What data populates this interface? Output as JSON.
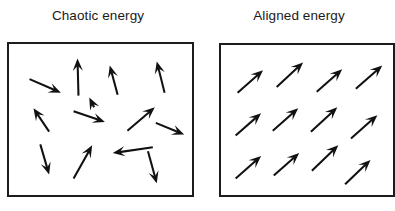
{
  "figure": {
    "width": 392,
    "height": 211,
    "background_color": "#ffffff",
    "ink_color": "#111111",
    "caption_color": "#1a1a1a",
    "type": "two-panel-vector-field-diagram"
  },
  "panels": [
    {
      "id": "chaotic",
      "title": "Chaotic energy",
      "box": {
        "x": 7,
        "y": 42,
        "width": 187,
        "height": 155,
        "border_color": "#1c1c1c",
        "border_width": 2.2
      },
      "arrow_count": 13,
      "arrow_arrangement": "random",
      "arrows": [
        {
          "name": "arrow-1",
          "x1": 28,
          "y1": 78,
          "x2": 60,
          "y2": 92,
          "angle_deg": 24
        },
        {
          "name": "arrow-2",
          "x1": 78,
          "y1": 95,
          "x2": 77,
          "y2": 57,
          "angle_deg": 272
        },
        {
          "name": "arrow-3",
          "x1": 118,
          "y1": 94,
          "x2": 110,
          "y2": 64,
          "angle_deg": 255
        },
        {
          "name": "arrow-4",
          "x1": 166,
          "y1": 92,
          "x2": 158,
          "y2": 60,
          "angle_deg": 256
        },
        {
          "name": "arrow-5",
          "x1": 48,
          "y1": 132,
          "x2": 32,
          "y2": 108,
          "angle_deg": 236
        },
        {
          "name": "arrow-6",
          "x1": 73,
          "y1": 111,
          "x2": 105,
          "y2": 122,
          "angle_deg": 19
        },
        {
          "name": "arrow-7",
          "x1": 128,
          "y1": 131,
          "x2": 156,
          "y2": 107,
          "angle_deg": 319
        },
        {
          "name": "arrow-8",
          "x1": 157,
          "y1": 123,
          "x2": 186,
          "y2": 135,
          "angle_deg": 22
        },
        {
          "name": "arrow-9",
          "x1": 39,
          "y1": 145,
          "x2": 48,
          "y2": 176,
          "angle_deg": 74
        },
        {
          "name": "arrow-10",
          "x1": 73,
          "y1": 180,
          "x2": 92,
          "y2": 146,
          "angle_deg": 299
        },
        {
          "name": "arrow-11",
          "x1": 154,
          "y1": 148,
          "x2": 113,
          "y2": 154,
          "angle_deg": 188
        },
        {
          "name": "arrow-12",
          "x1": 149,
          "y1": 152,
          "x2": 158,
          "y2": 185,
          "angle_deg": 75
        },
        {
          "name": "arrow-13",
          "x1": 94,
          "y1": 107,
          "x2": 89,
          "y2": 97,
          "angle_deg": 243
        }
      ]
    },
    {
      "id": "aligned",
      "title": "Aligned energy",
      "box": {
        "x": 219,
        "y": 43,
        "width": 176,
        "height": 154,
        "border_color": "#1c1c1c",
        "border_width": 2.2
      },
      "arrow_count": 12,
      "arrow_arrangement": "grid",
      "common_angle_deg": 315,
      "grid": {
        "rows": 3,
        "cols": 4
      },
      "arrows": [
        {
          "name": "arrow-r1c1",
          "x1": 236,
          "y1": 92,
          "x2": 262,
          "y2": 69
        },
        {
          "name": "arrow-r1c2",
          "x1": 276,
          "y1": 86,
          "x2": 303,
          "y2": 61
        },
        {
          "name": "arrow-r1c3",
          "x1": 317,
          "y1": 91,
          "x2": 343,
          "y2": 68
        },
        {
          "name": "arrow-r1c4",
          "x1": 357,
          "y1": 88,
          "x2": 384,
          "y2": 64
        },
        {
          "name": "arrow-r2c1",
          "x1": 234,
          "y1": 136,
          "x2": 260,
          "y2": 113
        },
        {
          "name": "arrow-r2c2",
          "x1": 272,
          "y1": 131,
          "x2": 298,
          "y2": 108
        },
        {
          "name": "arrow-r2c3",
          "x1": 311,
          "y1": 132,
          "x2": 338,
          "y2": 107
        },
        {
          "name": "arrow-r2c4",
          "x1": 352,
          "y1": 139,
          "x2": 379,
          "y2": 115
        },
        {
          "name": "arrow-r3c1",
          "x1": 234,
          "y1": 180,
          "x2": 260,
          "y2": 157
        },
        {
          "name": "arrow-r3c2",
          "x1": 273,
          "y1": 177,
          "x2": 299,
          "y2": 154
        },
        {
          "name": "arrow-r3c3",
          "x1": 312,
          "y1": 172,
          "x2": 339,
          "y2": 146
        },
        {
          "name": "arrow-r3c4",
          "x1": 346,
          "y1": 186,
          "x2": 372,
          "y2": 161
        }
      ]
    }
  ]
}
